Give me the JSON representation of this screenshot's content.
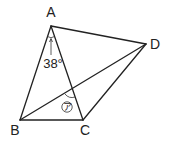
{
  "diagram": {
    "type": "geometry-figure",
    "vertices": [
      {
        "name": "A",
        "x": 51,
        "y": 26,
        "label_x": 51,
        "label_y": 17
      },
      {
        "name": "B",
        "x": 20,
        "y": 120,
        "label_x": 15,
        "label_y": 135
      },
      {
        "name": "C",
        "x": 83,
        "y": 120,
        "label_x": 85,
        "label_y": 135
      },
      {
        "name": "D",
        "x": 146,
        "y": 44,
        "label_x": 155,
        "label_y": 49
      }
    ],
    "segments": [
      "AB",
      "AC",
      "BC",
      "AD",
      "BD",
      "CD"
    ],
    "labels": {
      "A": "A",
      "B": "B",
      "C": "C",
      "D": "D"
    },
    "angle_annotation": {
      "vertex": "A",
      "value": "38°",
      "between": [
        "AB",
        "AC"
      ]
    },
    "unknown_angle": {
      "mark": "ア",
      "location": "intersection of BD and AC",
      "description": "angle ア"
    }
  }
}
